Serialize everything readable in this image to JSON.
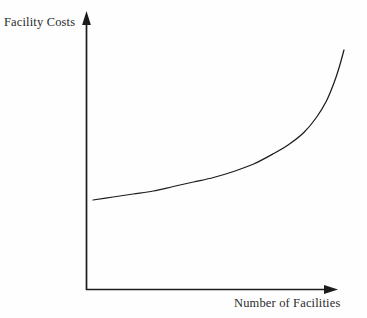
{
  "chart_data": {
    "type": "line",
    "title": "",
    "xlabel": "Number of Facilities",
    "ylabel": "Facility Costs",
    "grid": false,
    "legend": null,
    "axis_style": "arrow-axes-no-ticks",
    "tick_labels": {
      "x": [],
      "y": []
    },
    "xlim": [
      0,
      1
    ],
    "ylim": [
      0,
      1
    ],
    "series": [
      {
        "name": "Facility Costs",
        "color": "#1c1c1c",
        "x": [
          0.0,
          0.08,
          0.16,
          0.24,
          0.32,
          0.4,
          0.48,
          0.56,
          0.64,
          0.72,
          0.78,
          0.84,
          0.89,
          0.93,
          0.96,
          0.98,
          1.0
        ],
        "y": [
          0.0,
          0.02,
          0.04,
          0.06,
          0.09,
          0.12,
          0.15,
          0.19,
          0.24,
          0.31,
          0.37,
          0.45,
          0.55,
          0.66,
          0.78,
          0.88,
          1.0
        ]
      }
    ],
    "pixel_geometry": {
      "origin": [
        86,
        290
      ],
      "y_axis_top": [
        86,
        12
      ],
      "x_axis_right": [
        337,
        290
      ],
      "curve_start": [
        93,
        200
      ],
      "curve_end": [
        344,
        50
      ]
    }
  },
  "labels": {
    "y_axis": "Facility Costs",
    "x_axis": "Number of Facilities"
  },
  "colors": {
    "background": "#fefefe",
    "axis": "#1c1c1c",
    "curve": "#1c1c1c",
    "text": "#2b2b2b"
  }
}
